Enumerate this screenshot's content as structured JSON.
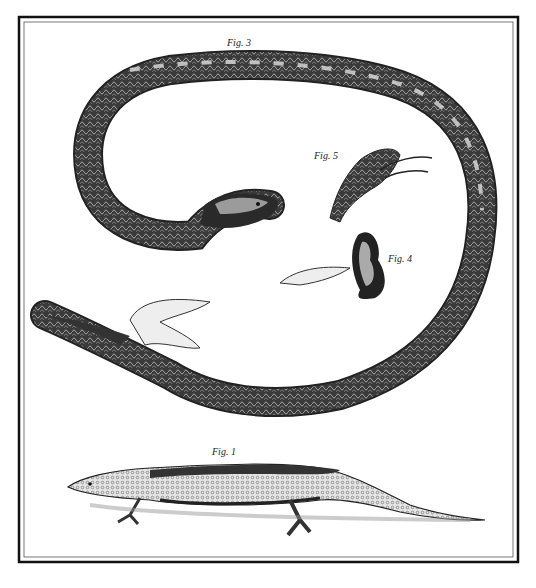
{
  "plate": {
    "frame_color": "#111111",
    "background": "#ffffff",
    "ink": "#1a1a1a"
  },
  "labels": {
    "fig3": "Fig. 3",
    "fig5": "Fig. 5",
    "fig4": "Fig. 4",
    "fig1": "Fig. 1"
  },
  "figures": [
    {
      "id": "fig3",
      "subject": "coiled snake with diamond-pattern scales"
    },
    {
      "id": "fig5",
      "subject": "dissected snake head with open jaws"
    },
    {
      "id": "fig4",
      "subject": "coiled organ with attached membrane"
    },
    {
      "id": "fig1",
      "subject": "lizard in profile"
    }
  ]
}
